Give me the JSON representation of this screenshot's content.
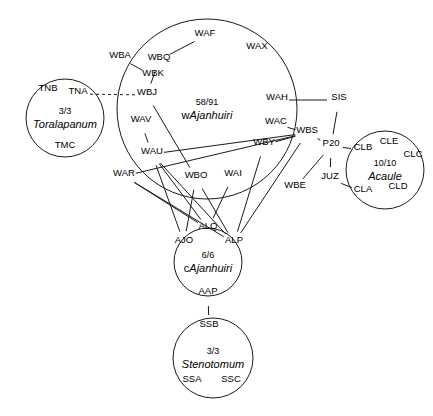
{
  "diagram": {
    "canvas": {
      "width": 433,
      "height": 416
    },
    "stroke_color": "#1a1a1a",
    "background": "#ffffff",
    "groups": [
      {
        "id": "toralapanum",
        "count": "3/3",
        "name": "Toralapanum",
        "name_prefix": "",
        "cx": 65,
        "cy": 118,
        "r": 39,
        "members": [
          {
            "id": "TNB",
            "label": "TNB",
            "x": 48,
            "y": 91
          },
          {
            "id": "TNA",
            "label": "TNA",
            "x": 78,
            "y": 94
          },
          {
            "id": "TMC",
            "label": "TMC",
            "x": 65,
            "y": 148
          }
        ]
      },
      {
        "id": "wajanhuiri",
        "count": "58/91",
        "name": "Ajanhuiri",
        "name_prefix": "w",
        "cx": 207,
        "cy": 109,
        "r": 90,
        "members": [
          {
            "id": "WAF",
            "label": "WAF",
            "x": 205,
            "y": 36
          },
          {
            "id": "WAX",
            "label": "WAX",
            "x": 257,
            "y": 49
          },
          {
            "id": "WBA",
            "label": "WBA",
            "x": 120,
            "y": 58
          },
          {
            "id": "WBQ",
            "label": "WBQ",
            "x": 159,
            "y": 60
          },
          {
            "id": "WBK",
            "label": "WBK",
            "x": 153,
            "y": 76
          },
          {
            "id": "WBJ",
            "label": "WBJ",
            "x": 147,
            "y": 95
          },
          {
            "id": "WAH",
            "label": "WAH",
            "x": 277,
            "y": 100
          },
          {
            "id": "WAC",
            "label": "WAC",
            "x": 276,
            "y": 124
          },
          {
            "id": "WBS",
            "label": "WBS",
            "x": 307,
            "y": 133
          },
          {
            "id": "WAV",
            "label": "WAV",
            "x": 141,
            "y": 122
          },
          {
            "id": "WBY",
            "label": "WBY",
            "x": 264,
            "y": 145
          },
          {
            "id": "WAU",
            "label": "WAU",
            "x": 152,
            "y": 154
          },
          {
            "id": "WAR",
            "label": "WAR",
            "x": 124,
            "y": 176
          },
          {
            "id": "WBO",
            "label": "WBO",
            "x": 196,
            "y": 178
          },
          {
            "id": "WAI",
            "label": "WAI",
            "x": 233,
            "y": 176
          },
          {
            "id": "WBE",
            "label": "WBE",
            "x": 295,
            "y": 188
          }
        ]
      },
      {
        "id": "acaule",
        "count": "10/10",
        "name": "Acaule",
        "name_prefix": "",
        "cx": 385,
        "cy": 170,
        "r": 39,
        "members": [
          {
            "id": "CLB",
            "label": "CLB",
            "x": 363,
            "y": 150
          },
          {
            "id": "CLE",
            "label": "CLE",
            "x": 389,
            "y": 144
          },
          {
            "id": "CLC",
            "label": "CLC",
            "x": 413,
            "y": 157
          },
          {
            "id": "CLA",
            "label": "CLA",
            "x": 363,
            "y": 192
          },
          {
            "id": "CLD",
            "label": "CLD",
            "x": 398,
            "y": 189
          }
        ]
      },
      {
        "id": "cajanhuiri",
        "count": "6/6",
        "name": "Ajanhuiri",
        "name_prefix": "c",
        "cx": 208,
        "cy": 262,
        "r": 34,
        "members": [
          {
            "id": "ALQ",
            "label": "ALQ",
            "x": 208,
            "y": 229
          },
          {
            "id": "AJO",
            "label": "AJO",
            "x": 184,
            "y": 243
          },
          {
            "id": "ALP",
            "label": "ALP",
            "x": 234,
            "y": 243
          },
          {
            "id": "AAP",
            "label": "AAP",
            "x": 208,
            "y": 294
          }
        ]
      },
      {
        "id": "stenotomum",
        "count": "3/3",
        "name": "Stenotomum",
        "name_prefix": "",
        "cx": 213,
        "cy": 358,
        "r": 40,
        "members": [
          {
            "id": "SSB",
            "label": "SSB",
            "x": 209,
            "y": 327
          },
          {
            "id": "SSA",
            "label": "SSA",
            "x": 192,
            "y": 382
          },
          {
            "id": "SSC",
            "label": "SSC",
            "x": 231,
            "y": 382
          }
        ]
      }
    ],
    "external_nodes": [
      {
        "id": "SIS",
        "label": "SIS",
        "x": 339,
        "y": 100
      },
      {
        "id": "P20",
        "label": "P20",
        "x": 331,
        "y": 146
      },
      {
        "id": "JUZ",
        "label": "JUZ",
        "x": 330,
        "y": 179
      }
    ],
    "edges": [
      {
        "from": "TNA",
        "to": "WBJ",
        "style": "dashed"
      },
      {
        "from": "WBA",
        "to": "WBK",
        "style": "solid"
      },
      {
        "from": "WBQ",
        "to": "WBJ",
        "style": "solid"
      },
      {
        "from": "WBQ",
        "to": "WAF",
        "style": "solid"
      },
      {
        "from": "WAH",
        "to": "SIS",
        "style": "solid"
      },
      {
        "from": "SIS",
        "to": "P20",
        "style": "solid"
      },
      {
        "from": "P20",
        "to": "CLB",
        "style": "solid"
      },
      {
        "from": "P20",
        "to": "JUZ",
        "style": "solid"
      },
      {
        "from": "JUZ",
        "to": "CLA",
        "style": "solid"
      },
      {
        "from": "WBS",
        "to": "P20",
        "style": "solid"
      },
      {
        "from": "WBE",
        "to": "P20",
        "style": "solid"
      },
      {
        "from": "WAC",
        "to": "WBS",
        "style": "solid"
      },
      {
        "from": "WBY",
        "to": "WBS",
        "style": "solid"
      },
      {
        "from": "WAU",
        "to": "WBS",
        "style": "solid"
      },
      {
        "from": "WAR",
        "to": "WBS",
        "style": "solid"
      },
      {
        "from": "WAV",
        "to": "WAU",
        "style": "solid"
      },
      {
        "from": "WBJ",
        "to": "WBO",
        "style": "solid"
      },
      {
        "from": "WAU",
        "to": "AJO",
        "style": "solid"
      },
      {
        "from": "WAU",
        "to": "ALQ",
        "style": "solid"
      },
      {
        "from": "WAU",
        "to": "ALP",
        "style": "solid"
      },
      {
        "from": "WAR",
        "to": "ALQ",
        "style": "solid"
      },
      {
        "from": "WAR",
        "to": "ALP",
        "style": "solid"
      },
      {
        "from": "WBO",
        "to": "AJO",
        "style": "solid"
      },
      {
        "from": "WBO",
        "to": "ALP",
        "style": "solid"
      },
      {
        "from": "WAI",
        "to": "ALQ",
        "style": "solid"
      },
      {
        "from": "WBY",
        "to": "ALP",
        "style": "solid"
      },
      {
        "from": "WBS",
        "to": "ALP",
        "style": "solid"
      },
      {
        "from": "AAP",
        "to": "SSB",
        "style": "solid"
      }
    ]
  }
}
